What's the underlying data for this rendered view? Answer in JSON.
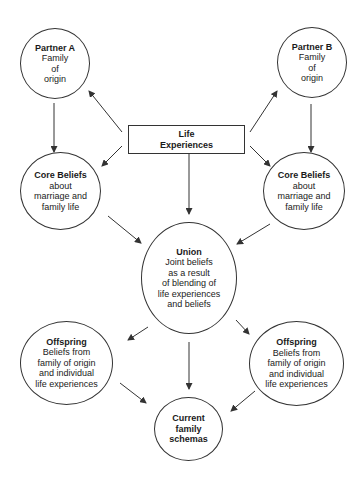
{
  "diagram": {
    "type": "flow",
    "nodes": {
      "partner_a": {
        "title": "Partner A",
        "lines": [
          "Family",
          "of",
          "origin"
        ]
      },
      "partner_b": {
        "title": "Partner B",
        "lines": [
          "Family",
          "of",
          "origin"
        ]
      },
      "life_experiences": {
        "title_lines": [
          "Life",
          "Experiences"
        ]
      },
      "core_beliefs_left": {
        "title": "Core Beliefs",
        "lines": [
          "about",
          "marriage and",
          "family life"
        ]
      },
      "core_beliefs_right": {
        "title": "Core Beliefs",
        "lines": [
          "about",
          "marriage and",
          "family life"
        ]
      },
      "union": {
        "title": "Union",
        "lines": [
          "Joint beliefs",
          "as a result",
          "of blending of",
          "life experiences",
          "and beliefs"
        ]
      },
      "offspring_left": {
        "title": "Offspring",
        "lines": [
          "Beliefs from",
          "family of origin",
          "and individual",
          "life experiences"
        ]
      },
      "offspring_right": {
        "title": "Offspring",
        "lines": [
          "Beliefs from",
          "family of origin",
          "and individual",
          "life experiences"
        ]
      },
      "current_family_schemas": {
        "title_lines": [
          "Current",
          "family",
          "schemas"
        ]
      }
    },
    "edges": [
      {
        "from": "life_experiences",
        "to": "partner_a"
      },
      {
        "from": "life_experiences",
        "to": "partner_b"
      },
      {
        "from": "partner_a",
        "to": "core_beliefs_left"
      },
      {
        "from": "partner_b",
        "to": "core_beliefs_right"
      },
      {
        "from": "life_experiences",
        "to": "core_beliefs_left"
      },
      {
        "from": "life_experiences",
        "to": "core_beliefs_right"
      },
      {
        "from": "life_experiences",
        "to": "union"
      },
      {
        "from": "core_beliefs_left",
        "to": "union"
      },
      {
        "from": "core_beliefs_right",
        "to": "union"
      },
      {
        "from": "union",
        "to": "offspring_left"
      },
      {
        "from": "union",
        "to": "offspring_right"
      },
      {
        "from": "union",
        "to": "current_family_schemas"
      },
      {
        "from": "offspring_left",
        "to": "current_family_schemas"
      },
      {
        "from": "offspring_right",
        "to": "current_family_schemas"
      }
    ],
    "colors": {
      "stroke": "#333333",
      "text": "#1a1a1a",
      "background": "#ffffff"
    }
  }
}
